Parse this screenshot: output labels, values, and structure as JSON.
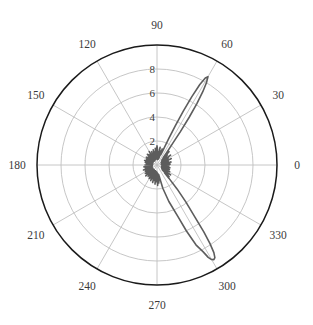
{
  "chart_data": {
    "type": "line",
    "subtype": "polar",
    "title": "",
    "xlabel": "",
    "ylabel": "",
    "angular_unit": "degrees",
    "angular_tick_labels": [
      "0",
      "30",
      "60",
      "90",
      "120",
      "150",
      "180",
      "210",
      "240",
      "270",
      "300",
      "330"
    ],
    "angular_tick_values": [
      0,
      30,
      60,
      90,
      120,
      150,
      180,
      210,
      240,
      270,
      300,
      330
    ],
    "radial_tick_labels": [
      "2",
      "4",
      "6",
      "8"
    ],
    "radial_tick_values": [
      2,
      4,
      6,
      8
    ],
    "rlim": [
      0,
      10
    ],
    "grid": true,
    "legend": "none",
    "theta_direction": "counterclockwise",
    "theta_zero_location": "E",
    "series": [
      {
        "name": "response",
        "color": "#5d5d5d",
        "line_width": 1.6,
        "description": "Two narrow high-gain lobes near 60 deg and 302 deg, dense low-amplitude sidelobe cluster near origin",
        "theta": [
          0,
          2,
          4,
          6,
          8,
          10,
          12,
          14,
          16,
          18,
          20,
          22,
          24,
          26,
          28,
          30,
          32,
          34,
          36,
          38,
          40,
          42,
          44,
          46,
          48,
          50,
          52,
          54,
          55,
          56,
          57,
          58,
          59,
          60,
          61,
          62,
          63,
          64,
          65,
          66,
          68,
          70,
          72,
          74,
          76,
          78,
          80,
          82,
          84,
          86,
          88,
          90,
          92,
          94,
          96,
          98,
          100,
          102,
          104,
          106,
          108,
          110,
          112,
          114,
          116,
          118,
          120,
          122,
          124,
          126,
          128,
          130,
          132,
          134,
          136,
          138,
          140,
          142,
          144,
          146,
          148,
          150,
          152,
          154,
          156,
          158,
          160,
          162,
          164,
          166,
          168,
          170,
          172,
          174,
          176,
          178,
          180,
          182,
          184,
          186,
          188,
          190,
          192,
          194,
          196,
          198,
          200,
          202,
          204,
          206,
          208,
          210,
          212,
          214,
          216,
          218,
          220,
          222,
          224,
          226,
          228,
          230,
          232,
          234,
          236,
          238,
          240,
          242,
          244,
          246,
          248,
          250,
          252,
          254,
          256,
          258,
          260,
          262,
          264,
          266,
          268,
          270,
          272,
          274,
          276,
          280,
          284,
          288,
          292,
          294,
          296,
          298,
          299,
          300,
          301,
          302,
          303,
          304,
          305,
          306,
          308,
          310,
          312,
          314,
          316,
          318,
          320,
          322,
          324,
          326,
          328,
          330,
          332,
          334,
          336,
          338,
          340,
          342,
          344,
          346,
          348,
          350,
          352,
          354,
          356,
          358,
          360
        ],
        "r": [
          0.9,
          0.5,
          1.1,
          0.4,
          0.9,
          0.35,
          1.2,
          0.5,
          0.8,
          0.4,
          1.0,
          0.45,
          1.3,
          0.5,
          0.9,
          0.4,
          1.1,
          0.5,
          1.4,
          0.6,
          1.0,
          0.5,
          1.2,
          0.6,
          1.5,
          0.8,
          1.3,
          2.2,
          3.4,
          4.8,
          6.1,
          7.2,
          8.0,
          8.5,
          8.3,
          7.6,
          6.4,
          5.0,
          3.6,
          2.4,
          1.3,
          0.9,
          1.4,
          0.6,
          1.2,
          0.5,
          1.5,
          0.6,
          1.1,
          0.45,
          1.3,
          1.6,
          1.2,
          0.5,
          1.4,
          0.55,
          1.1,
          0.5,
          1.3,
          0.6,
          0.9,
          0.45,
          1.2,
          0.5,
          1.0,
          0.4,
          1.3,
          0.55,
          0.9,
          0.4,
          1.1,
          0.5,
          1.2,
          0.45,
          0.9,
          0.4,
          1.0,
          0.5,
          1.1,
          0.45,
          0.8,
          0.4,
          1.0,
          0.5,
          0.9,
          0.4,
          1.1,
          0.45,
          0.8,
          0.35,
          1.0,
          0.45,
          0.9,
          0.4,
          0.85,
          0.4,
          1.0,
          0.45,
          0.9,
          0.4,
          1.1,
          0.5,
          0.95,
          0.4,
          1.0,
          0.45,
          1.2,
          0.5,
          0.9,
          0.45,
          1.1,
          0.5,
          1.0,
          0.45,
          1.2,
          0.5,
          1.1,
          0.45,
          1.3,
          0.55,
          1.0,
          0.5,
          1.2,
          0.5,
          1.1,
          0.45,
          1.3,
          0.55,
          1.2,
          0.5,
          1.4,
          0.6,
          1.2,
          0.5,
          1.5,
          0.6,
          1.3,
          0.55,
          1.6,
          0.7,
          1.4,
          0.6,
          1.7,
          0.7,
          1.5,
          0.8,
          2.0,
          3.2,
          4.6,
          6.0,
          7.4,
          8.2,
          8.8,
          9.1,
          9.2,
          9.1,
          8.7,
          7.9,
          6.8,
          5.4,
          3.9,
          2.6,
          1.5,
          0.9,
          1.4,
          0.6,
          1.2,
          0.5,
          1.4,
          0.6,
          1.0,
          0.45,
          1.2,
          0.5,
          0.9,
          0.4,
          1.1,
          0.5,
          0.95,
          0.4,
          1.1,
          0.45,
          0.9,
          0.4,
          1.0,
          0.45,
          0.9
        ]
      }
    ]
  },
  "axes": {
    "outer_circle_color": "#1a1a1a",
    "grid_color": "#c0c0c0",
    "text_color": "#3a3a3a",
    "background": "#ffffff"
  }
}
